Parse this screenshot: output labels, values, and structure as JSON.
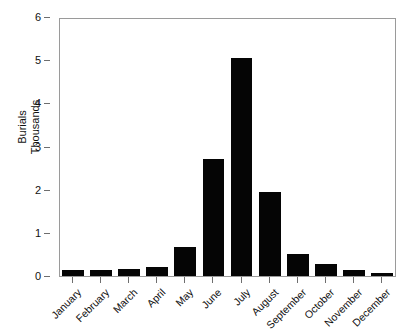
{
  "chart_data": {
    "type": "bar",
    "title": "",
    "xlabel": "",
    "ylabel": "Burials Thousands",
    "ylabel_lines": [
      "Burials",
      "Thousands"
    ],
    "categories": [
      "January",
      "February",
      "March",
      "April",
      "May",
      "June",
      "July",
      "August",
      "September",
      "October",
      "November",
      "December"
    ],
    "values": [
      0.13,
      0.13,
      0.16,
      0.21,
      0.67,
      2.7,
      5.05,
      1.95,
      0.5,
      0.28,
      0.13,
      0.06
    ],
    "ylim": [
      0,
      6
    ],
    "y_ticks": [
      0,
      1,
      2,
      3,
      4,
      5,
      6
    ],
    "y_tick_labels": [
      "0",
      "1",
      "2",
      "3",
      "4",
      "5",
      "6"
    ],
    "grid": false,
    "legend": null,
    "series": [
      {
        "name": "Burials",
        "values": [
          0.13,
          0.13,
          0.16,
          0.21,
          0.67,
          2.7,
          5.05,
          1.95,
          0.5,
          0.28,
          0.13,
          0.06
        ]
      }
    ],
    "bar_color": "#050505",
    "axis_color": "#9a9a9a",
    "background_color": "#ffffff"
  }
}
